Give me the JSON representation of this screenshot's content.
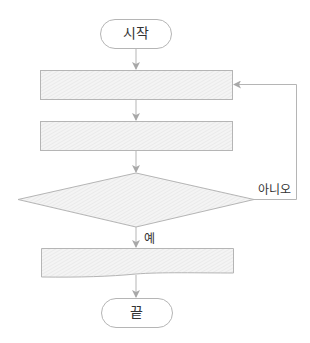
{
  "diagram": {
    "type": "flowchart",
    "colors": {
      "stroke": "#b5b5b5",
      "fill": "#f2f2f2",
      "hatch": "#e2e2e2",
      "arrow": "#a8a8a8",
      "text": "#333333"
    },
    "nodes": {
      "start": {
        "shape": "terminal",
        "label": "시작"
      },
      "process1": {
        "shape": "process",
        "label": ""
      },
      "process2": {
        "shape": "process",
        "label": ""
      },
      "decision": {
        "shape": "decision",
        "label": ""
      },
      "output": {
        "shape": "document",
        "label": ""
      },
      "end": {
        "shape": "terminal",
        "label": "끝"
      }
    },
    "edges": {
      "no_label": "아니오",
      "yes_label": "예"
    }
  }
}
